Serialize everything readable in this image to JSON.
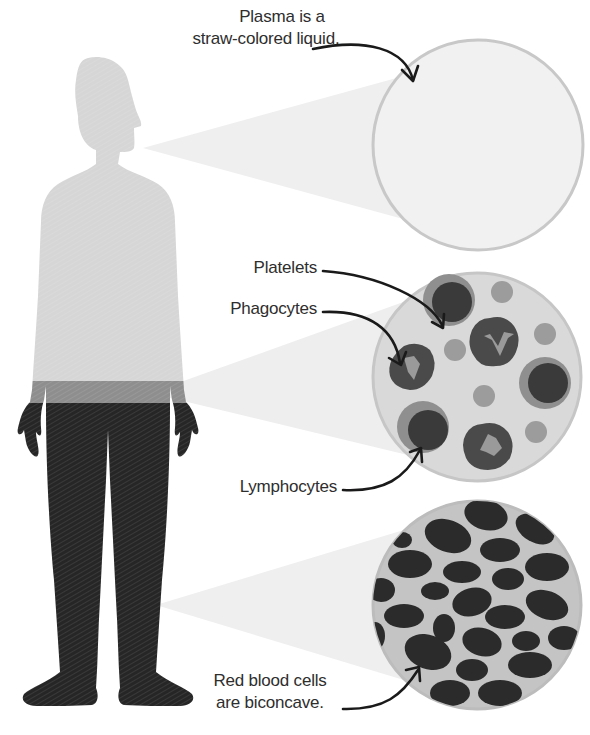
{
  "diagram": {
    "colors": {
      "background": "#ffffff",
      "body_upper": "#d6d6d6",
      "buffy_band": "#8e8e8e",
      "body_lower": "#262626",
      "beam": "#ececec",
      "plasma_fill": "#f1f1f1",
      "circle_border": "#c8c8c8",
      "wbc_fill": "#d9d9d9",
      "lymphocyte_outer": "#8f8f8f",
      "lymphocyte_nucleus": "#3a3a3a",
      "phagocyte_body": "#4a4a4a",
      "phagocyte_granule": "#9a9a9a",
      "platelet": "#9c9c9c",
      "rbc_fill": "#c4c4c4",
      "rbc_cell": "#2b2b2b",
      "arrow": "#1a1a1a",
      "text": "#2e2e2e"
    },
    "labels": {
      "plasma_line1": "Plasma is a",
      "plasma_line2": "straw-colored liquid.",
      "platelets": "Platelets",
      "phagocytes": "Phagocytes",
      "lymphocytes": "Lymphocytes",
      "rbc_line1": "Red blood cells",
      "rbc_line2": "are biconcave."
    },
    "panels": [
      {
        "id": "plasma",
        "title": "Plasma",
        "layer": "upper body (light)"
      },
      {
        "id": "buffy-coat",
        "title": "White blood cells and platelets",
        "layer": "middle band"
      },
      {
        "id": "red-cells",
        "title": "Red blood cells",
        "layer": "lower body (dark)"
      }
    ],
    "icons": [
      "human-silhouette-icon",
      "plasma-circle-icon",
      "white-cells-circle-icon",
      "red-cells-circle-icon",
      "curved-arrow-icon"
    ]
  }
}
